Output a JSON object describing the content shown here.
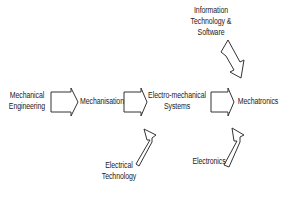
{
  "diagram": {
    "type": "flow",
    "nodes": {
      "mechanical_engineering": {
        "lines": [
          "Mechanical",
          "Engineering"
        ]
      },
      "mechanisation": {
        "lines": [
          "Mechanisation"
        ]
      },
      "electro_mechanical": {
        "lines": [
          "Electro-mechanical",
          "Systems"
        ]
      },
      "mechatronics": {
        "lines": [
          "Mechatronics"
        ]
      },
      "electrical_technology": {
        "lines": [
          "Electrical",
          "Technology"
        ]
      },
      "it_software": {
        "lines": [
          "Information",
          "Technology &",
          "Software"
        ]
      },
      "electronics": {
        "lines": [
          "Electronics"
        ]
      }
    },
    "edges": [
      {
        "from": "Mechanical Engineering",
        "to": "Mechanisation"
      },
      {
        "from": "Mechanisation",
        "to": "Electro-mechanical Systems"
      },
      {
        "from": "Electrical Technology",
        "to": "Electro-mechanical Systems"
      },
      {
        "from": "Electro-mechanical Systems",
        "to": "Mechatronics"
      },
      {
        "from": "Information Technology & Software",
        "to": "Mechatronics"
      },
      {
        "from": "Electronics",
        "to": "Mechatronics"
      }
    ]
  }
}
